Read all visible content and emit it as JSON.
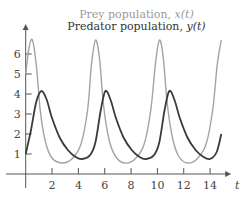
{
  "chart_data": {
    "type": "line",
    "title": "",
    "xlabel": "t",
    "ylabel": "",
    "xlim": [
      0,
      15
    ],
    "ylim": [
      0,
      7
    ],
    "grid": false,
    "legend_position": "top-center",
    "x_ticks": [
      2,
      4,
      6,
      8,
      10,
      12,
      14
    ],
    "y_ticks": [
      1,
      2,
      3,
      4,
      5,
      6
    ],
    "series": [
      {
        "name": "Prey population, x(t)",
        "color": "#a3a3a3",
        "points": [
          [
            0,
            5.0
          ],
          [
            0.25,
            6.3
          ],
          [
            0.5,
            6.7
          ],
          [
            0.8,
            5.5
          ],
          [
            1.1,
            3.2
          ],
          [
            1.5,
            1.6
          ],
          [
            2.0,
            0.8
          ],
          [
            2.75,
            0.55
          ],
          [
            3.5,
            0.75
          ],
          [
            4.2,
            1.5
          ],
          [
            4.7,
            3.2
          ],
          [
            5.0,
            5.5
          ],
          [
            5.3,
            6.7
          ],
          [
            5.6,
            5.8
          ],
          [
            5.9,
            3.5
          ],
          [
            6.3,
            1.8
          ],
          [
            6.8,
            0.9
          ],
          [
            7.5,
            0.55
          ],
          [
            8.3,
            0.75
          ],
          [
            9.0,
            1.5
          ],
          [
            9.5,
            3.2
          ],
          [
            9.85,
            5.5
          ],
          [
            10.15,
            6.7
          ],
          [
            10.45,
            5.8
          ],
          [
            10.75,
            3.5
          ],
          [
            11.15,
            1.8
          ],
          [
            11.6,
            0.9
          ],
          [
            12.25,
            0.55
          ],
          [
            13.0,
            0.75
          ],
          [
            13.7,
            1.5
          ],
          [
            14.2,
            3.2
          ],
          [
            14.55,
            5.5
          ],
          [
            14.85,
            6.7
          ]
        ]
      },
      {
        "name": "Predator population, y(t)",
        "color": "#3a3a3a",
        "points": [
          [
            0,
            1.0
          ],
          [
            0.4,
            2.2
          ],
          [
            0.8,
            3.6
          ],
          [
            1.2,
            4.15
          ],
          [
            1.6,
            3.7
          ],
          [
            2.0,
            2.8
          ],
          [
            2.6,
            1.8
          ],
          [
            3.2,
            1.2
          ],
          [
            3.8,
            0.85
          ],
          [
            4.3,
            0.75
          ],
          [
            4.9,
            0.95
          ],
          [
            5.3,
            1.6
          ],
          [
            5.7,
            3.2
          ],
          [
            6.05,
            4.15
          ],
          [
            6.45,
            3.7
          ],
          [
            6.85,
            2.8
          ],
          [
            7.45,
            1.8
          ],
          [
            8.05,
            1.2
          ],
          [
            8.65,
            0.85
          ],
          [
            9.15,
            0.75
          ],
          [
            9.75,
            0.95
          ],
          [
            10.15,
            1.6
          ],
          [
            10.55,
            3.2
          ],
          [
            10.9,
            4.15
          ],
          [
            11.3,
            3.7
          ],
          [
            11.7,
            2.8
          ],
          [
            12.3,
            1.8
          ],
          [
            12.9,
            1.2
          ],
          [
            13.5,
            0.85
          ],
          [
            14.0,
            0.75
          ],
          [
            14.5,
            1.1
          ],
          [
            14.85,
            2.0
          ]
        ]
      }
    ]
  },
  "legend": {
    "prey_label": "Prey population, ",
    "prey_var": "x(t)",
    "predator_label": "Predator population, ",
    "predator_var": "y(t)"
  },
  "axis": {
    "x_label": "t"
  }
}
